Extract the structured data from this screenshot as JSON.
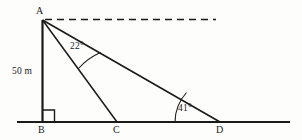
{
  "figure": {
    "type": "geometry-diagram",
    "background_color": "#fdfdfc",
    "stroke_color": "#1a1a1a",
    "vertices": {
      "A": {
        "label": "A",
        "x": 42,
        "y": 20
      },
      "B": {
        "label": "B",
        "x": 42,
        "y": 122
      },
      "C": {
        "label": "C",
        "x": 117,
        "y": 122
      },
      "D": {
        "label": "D",
        "x": 220,
        "y": 122
      }
    },
    "measurements": {
      "height": "50 m"
    },
    "angles": {
      "upper": "22°",
      "lower": "41°"
    },
    "ground_line": {
      "x1": 17,
      "x2": 290,
      "y": 122
    },
    "horizontal_dashed": {
      "x1": 45,
      "x2": 216,
      "y": 20
    },
    "right_angle_marker": {
      "x": 42,
      "y": 110,
      "size": 12
    }
  }
}
